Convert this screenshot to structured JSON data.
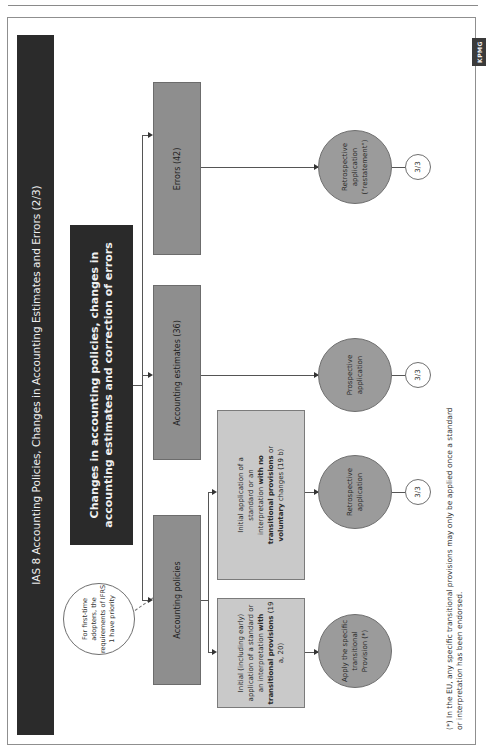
{
  "header": {
    "title": "IAS 8 Accounting Policies, Changes in Accounting Estimates and Errors (2/3)"
  },
  "central_box": {
    "text": "Changes in accounting policies, changes in accounting estimates and correction of errors"
  },
  "note": {
    "text": "For first-time adopters, the requirements of IFRS 1 have priority"
  },
  "categories": [
    {
      "label": "Accounting policies"
    },
    {
      "label": "Accounting estimates (36)"
    },
    {
      "label": "Errors (42)"
    }
  ],
  "policy_branches": [
    {
      "text_pre": "Initial (including early) application of a standard or an interpretation ",
      "text_bold": "with transitional provisions",
      "text_post": " (19 a, 20)"
    },
    {
      "text_pre": "Initial application of a standard or an interpretation ",
      "text_bold": "with no transitional provisions",
      "text_mid": " or ",
      "text_bold2": "voluntary",
      "text_post": " changes (19 b)"
    }
  ],
  "outcomes": [
    {
      "label": "Apply the specific transitional Provision (*)",
      "page_ref": ""
    },
    {
      "label": "Retrospective application",
      "page_ref": "3/3"
    },
    {
      "label": "Prospective application",
      "page_ref": "3/3"
    },
    {
      "label": "Retrospective application (\"restatement\")",
      "page_ref": "3/3"
    }
  ],
  "footnote": {
    "text": "(*) In the EU, any specific transitional provisions may only be applied once a standard or interpretation has been endorsed."
  },
  "logo": {
    "text": "KPMG"
  },
  "colors": {
    "dark_box": "#2b2b2b",
    "category_box": "#8e8e8e",
    "sub_box": "#c9c9c9",
    "outcome_circle": "#9b9b9b"
  }
}
